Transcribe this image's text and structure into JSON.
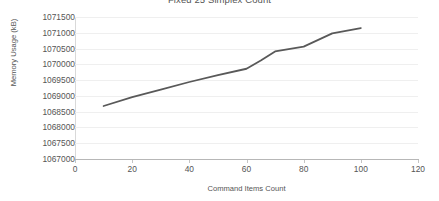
{
  "chart_data": {
    "type": "line",
    "title": "Fixed 25 Simplex Count",
    "xlabel": "Command Items Count",
    "ylabel": "Memory Usage (kB)",
    "xlim": [
      0,
      120
    ],
    "ylim": [
      1067000,
      1071500
    ],
    "xticks": [
      0,
      20,
      40,
      60,
      80,
      100,
      120
    ],
    "yticks": [
      1067000,
      1067500,
      1068000,
      1068500,
      1069000,
      1069500,
      1070000,
      1070500,
      1071000,
      1071500
    ],
    "xtick_labels": [
      "0",
      "20",
      "40",
      "60",
      "80",
      "100",
      "120"
    ],
    "ytick_labels": [
      "1067000",
      "1067500",
      "1068000",
      "1068500",
      "1069000",
      "1069500",
      "1070000",
      "1070500",
      "1071000",
      "1071500"
    ],
    "grid": true,
    "grid_axis": "y",
    "legend": false,
    "legend_position": "none",
    "line_color": "#595959",
    "line_width": 1.8,
    "series": [
      {
        "name": "Memory Usage",
        "x": [
          10,
          20,
          30,
          40,
          50,
          60,
          65,
          70,
          80,
          90,
          100
        ],
        "values": [
          1068680,
          1068960,
          1069200,
          1069440,
          1069660,
          1069860,
          1070120,
          1070410,
          1070560,
          1070980,
          1071150
        ]
      }
    ]
  },
  "axes": {
    "x_title": "Command Items Count",
    "y_title": "Memory Usage (kB)"
  },
  "title": "Fixed 25 Simplex Count"
}
